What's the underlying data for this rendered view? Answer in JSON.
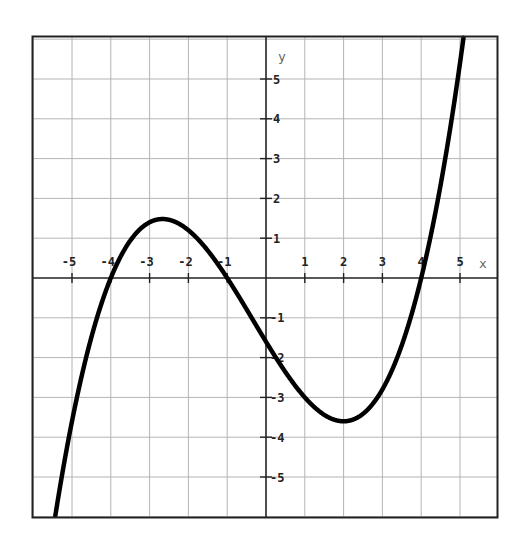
{
  "chart_data": {
    "type": "line",
    "title": "",
    "xlabel": "x",
    "ylabel": "y",
    "xlim": [
      -6,
      6
    ],
    "ylim": [
      -6,
      6
    ],
    "grid": true,
    "x_ticks": [
      -5,
      -4,
      -3,
      -2,
      -1,
      1,
      2,
      3,
      4,
      5
    ],
    "y_ticks": [
      5,
      4,
      3,
      2,
      1,
      -1,
      -2,
      -3,
      -4,
      -5
    ],
    "x_tick_labels": [
      "-5",
      "-4",
      "-3",
      "-2",
      "-1",
      "1",
      "2",
      "3",
      "4",
      "5"
    ],
    "y_tick_labels": [
      "5",
      "4",
      "3",
      "2",
      "1",
      "-1",
      "-2",
      "-3",
      "-4",
      "-5"
    ],
    "series": [
      {
        "name": "f(x)",
        "description": "cubic with roots at x=-4, x=-1, x=4; y-intercept about -1.6; local max about (-2.6, 1.5); local min about (2.1, -3.6)",
        "x": [
          -5.45,
          -5,
          -4.5,
          -4,
          -3.5,
          -3,
          -2.6,
          -2,
          -1.5,
          -1,
          -0.5,
          0,
          0.5,
          1,
          1.5,
          2,
          2.1,
          2.5,
          3,
          3.5,
          4,
          4.5,
          5,
          5.1
        ],
        "y": [
          -6.0,
          -3.6,
          -1.5,
          0,
          1.0,
          1.4,
          1.5,
          1.2,
          0.6,
          0,
          -0.8,
          -1.6,
          -2.3,
          -3.0,
          -3.4,
          -3.6,
          -3.6,
          -3.5,
          -2.8,
          -1.7,
          0,
          2.3,
          5.4,
          6.1
        ],
        "color": "#000000"
      }
    ]
  },
  "colors": {
    "grid": "#b4b4b4",
    "axis": "#222222",
    "border": "#222222",
    "curve": "#000000"
  }
}
